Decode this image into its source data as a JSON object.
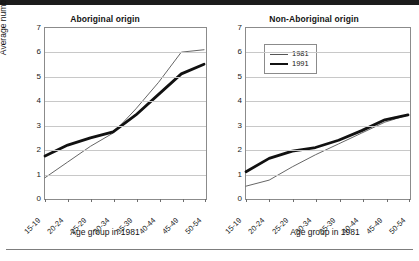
{
  "figure": {
    "yaxis_title": "Average number of children",
    "xaxis_title": "Age group in 1981"
  },
  "legend": {
    "position": "top-left-of-right-panel",
    "items": [
      {
        "label": "1981",
        "style": "thin"
      },
      {
        "label": "1991",
        "style": "thick"
      }
    ]
  },
  "colors": {
    "line_1981": "#555555",
    "line_1991": "#111111",
    "grid": "#c8c8c8",
    "frame": "#8b8b8b",
    "top_bar": "#1c1c1c"
  },
  "panels": {
    "left_title": "Aboriginal origin",
    "right_title": "Non-Aboriginal origin"
  },
  "footer": {
    "note": ""
  },
  "chart_data": [
    {
      "type": "line",
      "title": "Aboriginal origin",
      "xlabel": "Age group in 1981",
      "ylabel": "Average number of children",
      "ylim": [
        0,
        7
      ],
      "yticks": [
        0,
        1,
        2,
        3,
        4,
        5,
        6,
        7
      ],
      "grid": true,
      "legend": [
        "1981",
        "1991"
      ],
      "categories": [
        "15-19",
        "20-24",
        "25-29",
        "30-34",
        "35-39",
        "40-44",
        "45-49",
        "50-54"
      ],
      "series": [
        {
          "name": "1981",
          "values": [
            0.8,
            1.45,
            2.1,
            2.65,
            3.65,
            4.75,
            6.0,
            6.1
          ]
        },
        {
          "name": "1991",
          "values": [
            1.7,
            2.15,
            2.45,
            2.7,
            3.4,
            4.25,
            5.1,
            5.5
          ]
        }
      ]
    },
    {
      "type": "line",
      "title": "Non-Aboriginal origin",
      "xlabel": "Age group in 1981",
      "ylabel": "Average number of children",
      "ylim": [
        0,
        7
      ],
      "yticks": [
        0,
        1,
        2,
        3,
        4,
        5,
        6,
        7
      ],
      "grid": true,
      "legend": [
        "1981",
        "1991"
      ],
      "categories": [
        "15-19",
        "20-24",
        "25-29",
        "30-34",
        "35-39",
        "40-44",
        "45-49",
        "50-54"
      ],
      "series": [
        {
          "name": "1981",
          "values": [
            0.45,
            0.7,
            1.25,
            1.75,
            2.2,
            2.65,
            3.1,
            3.4
          ]
        },
        {
          "name": "1991",
          "values": [
            1.05,
            1.6,
            1.9,
            2.05,
            2.35,
            2.75,
            3.2,
            3.4
          ]
        }
      ]
    }
  ]
}
